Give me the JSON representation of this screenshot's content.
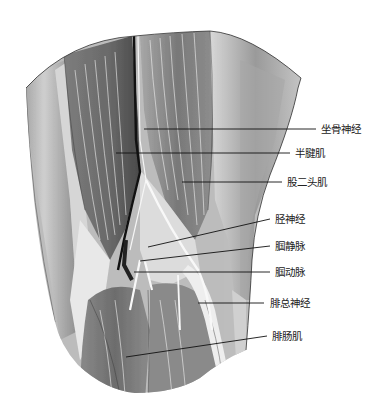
{
  "figure": {
    "labels": [
      {
        "id": "sciatic-nerve",
        "text": "坐骨神经",
        "x": 321,
        "y": 123,
        "line": [
          144,
          129,
          316,
          129
        ]
      },
      {
        "id": "semitendinosus",
        "text": "半腱肌",
        "x": 295,
        "y": 146,
        "line": [
          116,
          153,
          290,
          153
        ]
      },
      {
        "id": "biceps-femoris",
        "text": "股二头肌",
        "x": 287,
        "y": 176,
        "line": [
          182,
          182,
          282,
          182
        ]
      },
      {
        "id": "tibial-nerve",
        "text": "胫神经",
        "x": 275,
        "y": 213,
        "line": [
          148,
          247,
          270,
          219
        ]
      },
      {
        "id": "popliteal-vein",
        "text": "腘静脉",
        "x": 275,
        "y": 240,
        "line": [
          140,
          261,
          270,
          246
        ]
      },
      {
        "id": "popliteal-artery",
        "text": "腘动脉",
        "x": 275,
        "y": 266,
        "line": [
          134,
          272,
          270,
          272
        ]
      },
      {
        "id": "common-peroneal-nerve",
        "text": "腓总神经",
        "x": 270,
        "y": 297,
        "line": [
          198,
          303,
          264,
          303
        ]
      },
      {
        "id": "gastrocnemius",
        "text": "腓肠肌",
        "x": 272,
        "y": 330,
        "line": [
          126,
          357,
          267,
          336
        ]
      }
    ]
  }
}
